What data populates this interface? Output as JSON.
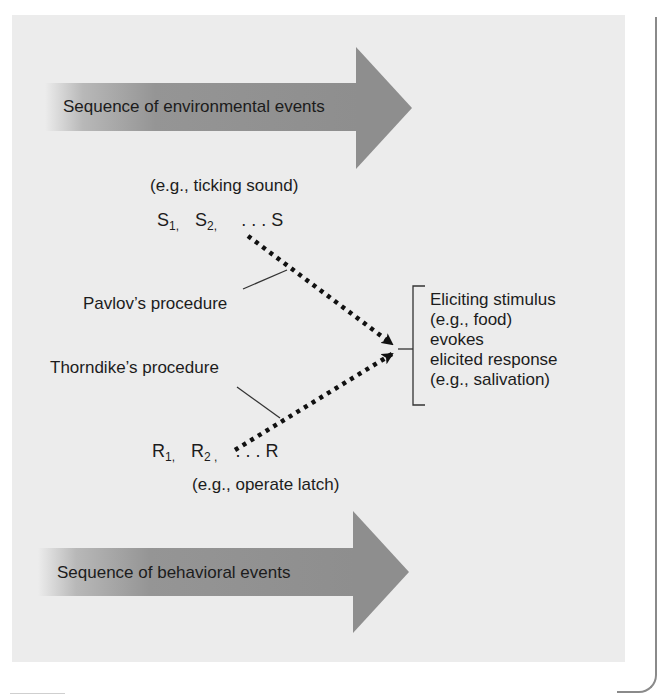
{
  "diagram": {
    "environment_arrow": {
      "label": "Sequence of environmental events"
    },
    "environment_example": "(e.g., ticking sound)",
    "stimulus_sequence": {
      "s1_base": "S",
      "s1_sub": "1,",
      "s2_base": "S",
      "s2_sub": "2,",
      "ellipsis": ". . .",
      "last": "S"
    },
    "pavlov_label": "Pavlov’s procedure",
    "thorndike_label": "Thorndike’s procedure",
    "response_sequence": {
      "r1_base": "R",
      "r1_sub": "1,",
      "r2_base": "R",
      "r2_sub": "2 ,",
      "ellipsis": ". . .",
      "last": "R"
    },
    "behavior_example": "(e.g., operate latch)",
    "behavior_arrow": {
      "label": "Sequence of behavioral events"
    },
    "outcome": {
      "lines": [
        "Eliciting stimulus",
        "(e.g., food)",
        "evokes",
        "elicited response",
        "(e.g., salivation)"
      ]
    },
    "colors": {
      "panel_background": "#ececec",
      "arrow_fill": "#8e8e8e",
      "arrow_fade": "#ececec",
      "dotted_line": "#111111",
      "text": "#1c1c1c",
      "frame_line": "#8a8a8a"
    }
  }
}
